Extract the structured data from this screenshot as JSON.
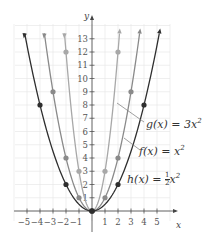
{
  "chart_data": {
    "type": "line",
    "title": "",
    "xlabel": "x",
    "ylabel": "y",
    "xlim": [
      -5,
      5
    ],
    "ylim": [
      0,
      13
    ],
    "x_ticks": [
      -5,
      -4,
      -3,
      -2,
      -1,
      1,
      2,
      3,
      4,
      5
    ],
    "y_ticks": [
      1,
      2,
      3,
      4,
      5,
      6,
      7,
      8,
      9,
      10,
      11,
      12,
      13
    ],
    "grid": true,
    "series": [
      {
        "name": "g(x) = 3x²",
        "color": "#a8a8a8",
        "coef": 3,
        "points": [
          [
            -2,
            12
          ],
          [
            -1,
            3
          ],
          [
            0,
            0
          ],
          [
            1,
            3
          ],
          [
            2,
            12
          ]
        ]
      },
      {
        "name": "f(x) = x²",
        "color": "#8a8a8a",
        "coef": 1,
        "points": [
          [
            -3,
            9
          ],
          [
            -2,
            4
          ],
          [
            -1,
            1
          ],
          [
            0,
            0
          ],
          [
            1,
            1
          ],
          [
            2,
            4
          ],
          [
            3,
            9
          ]
        ]
      },
      {
        "name": "h(x) = ½x²",
        "color": "#2e2e2e",
        "coef": 0.5,
        "points": [
          [
            -4,
            8
          ],
          [
            -2,
            2
          ],
          [
            0,
            0
          ],
          [
            2,
            2
          ],
          [
            4,
            8
          ]
        ]
      }
    ]
  },
  "labels": {
    "g": "g(x) = 3x",
    "f": "f(x) = x",
    "h_pre": "h(x) = ",
    "h_post": "x",
    "half_num": "1",
    "half_den": "2",
    "sup": "2",
    "x_axis": "x",
    "y_axis": "y"
  }
}
